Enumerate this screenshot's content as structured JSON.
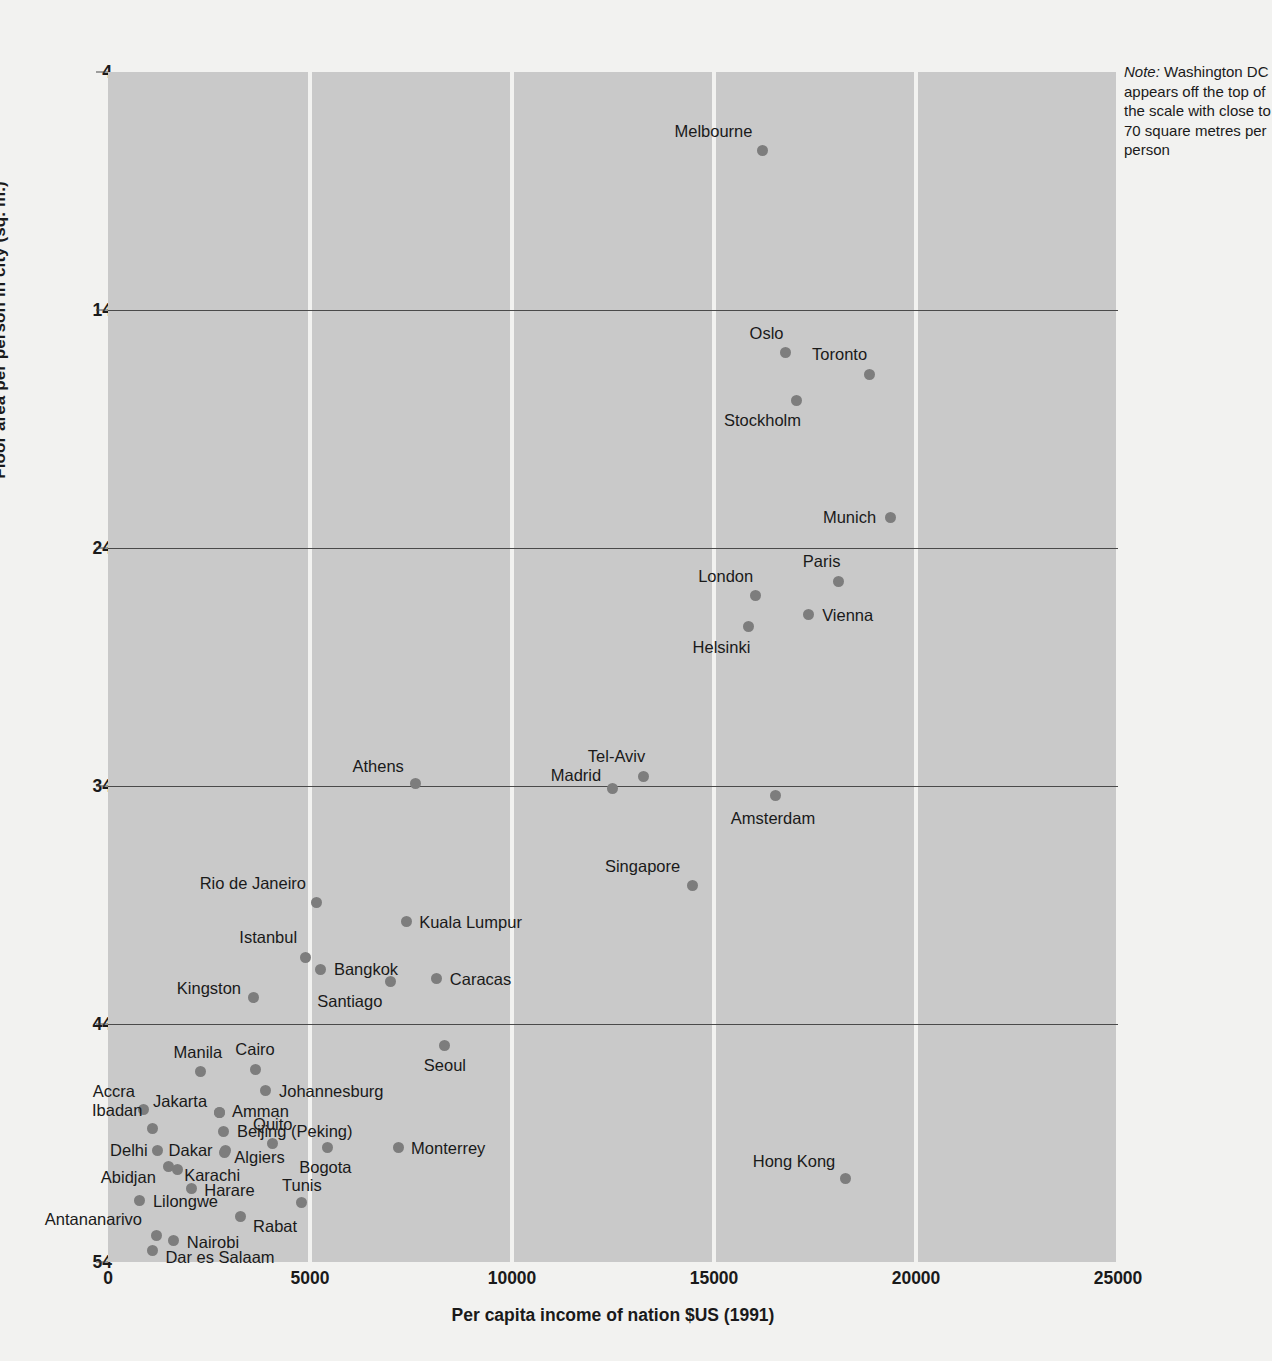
{
  "note": {
    "lead": "Note:",
    "text": " Washington DC appears off the top of the scale with close to 70 square metres per person"
  },
  "axes": {
    "y_title": "Floor area per person in city (sq. m.)",
    "x_title": "Per capita income of nation $US (1991)",
    "y_ticks": [
      "54",
      "44",
      "34",
      "24",
      "14",
      "4"
    ],
    "x_ticks": [
      "0",
      "5000",
      "10000",
      "15000",
      "20000",
      "25000"
    ]
  },
  "colors": {
    "plot_background": "#c9c9c9",
    "page_background": "#f2f2f0",
    "point": "#7d7d7d",
    "gridline": "#4a4a4a",
    "band": "#f2f2f0",
    "text": "#1a1a1a"
  },
  "chart_data": {
    "type": "scatter",
    "title": "",
    "xlabel": "Per capita income of nation $US (1991)",
    "ylabel": "Floor area per person in city (sq. m.)",
    "xlim": [
      0,
      25000
    ],
    "ylim": [
      4,
      54
    ],
    "xticks": [
      0,
      5000,
      10000,
      15000,
      20000,
      25000
    ],
    "yticks": [
      4,
      14,
      24,
      34,
      44,
      54
    ],
    "grid": "horizontal gridlines at y ticks; vertical white bands at x ticks",
    "legend": "none",
    "annotations": [
      "Note: Washington DC appears off the top of the scale with close to 70 square metres per person"
    ],
    "points": [
      {
        "label": "Melbourne",
        "x": 16200,
        "y": 50.7,
        "lx": -10,
        "ly": -20,
        "anchor": "r"
      },
      {
        "label": "Oslo",
        "x": 16770,
        "y": 42.2,
        "lx": -2,
        "ly": -20,
        "anchor": "r"
      },
      {
        "label": "Toronto",
        "x": 18840,
        "y": 41.3,
        "lx": -2,
        "ly": -20,
        "anchor": "r"
      },
      {
        "label": "Stockholm",
        "x": 17030,
        "y": 40.2,
        "lx": 5,
        "ly": 20,
        "anchor": "r"
      },
      {
        "label": "Munich",
        "x": 19360,
        "y": 35.3,
        "lx": -14,
        "ly": 0,
        "anchor": "r"
      },
      {
        "label": "Paris",
        "x": 18080,
        "y": 32.6,
        "lx": 2,
        "ly": -20,
        "anchor": "r"
      },
      {
        "label": "London",
        "x": 16020,
        "y": 32.0,
        "lx": -2,
        "ly": -20,
        "anchor": "r"
      },
      {
        "label": "Vienna",
        "x": 17330,
        "y": 31.2,
        "lx": 14,
        "ly": 0,
        "anchor": "l"
      },
      {
        "label": "Helsinki",
        "x": 15850,
        "y": 30.7,
        "lx": 2,
        "ly": 20,
        "anchor": "r"
      },
      {
        "label": "Tel-Aviv",
        "x": 13250,
        "y": 24.4,
        "lx": 2,
        "ly": -20,
        "anchor": "r"
      },
      {
        "label": "Madrid",
        "x": 12480,
        "y": 23.9,
        "lx": -11,
        "ly": -13,
        "anchor": "r"
      },
      {
        "label": "Athens",
        "x": 7620,
        "y": 24.1,
        "lx": -12,
        "ly": -18,
        "anchor": "r"
      },
      {
        "label": "Amsterdam",
        "x": 16510,
        "y": 23.6,
        "lx": -2,
        "ly": 22,
        "anchor": "c"
      },
      {
        "label": "Singapore",
        "x": 14460,
        "y": 19.8,
        "lx": -12,
        "ly": -20,
        "anchor": "r"
      },
      {
        "label": "Rio de Janeiro",
        "x": 5150,
        "y": 19.1,
        "lx": -10,
        "ly": -20,
        "anchor": "r"
      },
      {
        "label": "Kuala Lumpur",
        "x": 7380,
        "y": 18.3,
        "lx": 13,
        "ly": 0,
        "anchor": "l"
      },
      {
        "label": "Istanbul",
        "x": 4880,
        "y": 16.8,
        "lx": -8,
        "ly": -20,
        "anchor": "r"
      },
      {
        "label": "Bangkok",
        "x": 5270,
        "y": 16.3,
        "lx": 13,
        "ly": 0,
        "anchor": "l"
      },
      {
        "label": "Caracas",
        "x": 8140,
        "y": 15.9,
        "lx": 13,
        "ly": 0,
        "anchor": "l"
      },
      {
        "label": "Santiago",
        "x": 6990,
        "y": 15.8,
        "lx": -8,
        "ly": 20,
        "anchor": "r"
      },
      {
        "label": "Kingston",
        "x": 3590,
        "y": 15.1,
        "lx": -12,
        "ly": -10,
        "anchor": "r"
      },
      {
        "label": "Seoul",
        "x": 8340,
        "y": 13.1,
        "lx": 0,
        "ly": 20,
        "anchor": "c"
      },
      {
        "label": "Cairo",
        "x": 3640,
        "y": 12.1,
        "lx": 0,
        "ly": -20,
        "anchor": "c"
      },
      {
        "label": "Manila",
        "x": 2300,
        "y": 12.0,
        "lx": -3,
        "ly": -20,
        "anchor": "c"
      },
      {
        "label": "Johannesburg",
        "x": 3910,
        "y": 11.2,
        "lx": 13,
        "ly": 0,
        "anchor": "l"
      },
      {
        "label": "Jakarta",
        "x": 2750,
        "y": 10.3,
        "lx": -12,
        "ly": -11,
        "anchor": "r"
      },
      {
        "label": "Accra",
        "x": 890,
        "y": 10.4,
        "lx": -9,
        "ly": -19,
        "anchor": "r"
      },
      {
        "label": "Amman",
        "x": 2750,
        "y": 10.3,
        "lx": 13,
        "ly": -1,
        "anchor": "l"
      },
      {
        "label": "Beijing (Peking)",
        "x": 2870,
        "y": 9.5,
        "lx": 13,
        "ly": 0,
        "anchor": "l"
      },
      {
        "label": "Ibadan",
        "x": 1100,
        "y": 9.6,
        "lx": -10,
        "ly": -19,
        "anchor": "r"
      },
      {
        "label": "Quito",
        "x": 4080,
        "y": 9.0,
        "lx": 0,
        "ly": -19,
        "anchor": "c"
      },
      {
        "label": "Delhi",
        "x": 1230,
        "y": 8.7,
        "lx": -10,
        "ly": 0,
        "anchor": "r"
      },
      {
        "label": "Dakar",
        "x": 2910,
        "y": 8.7,
        "lx": -13,
        "ly": 0,
        "anchor": "r"
      },
      {
        "label": "Algiers",
        "x": 2880,
        "y": 8.6,
        "lx": 10,
        "ly": 4,
        "anchor": "l"
      },
      {
        "label": "Bogota",
        "x": 5430,
        "y": 8.8,
        "lx": -2,
        "ly": 19,
        "anchor": "c"
      },
      {
        "label": "Monterrey",
        "x": 7180,
        "y": 8.8,
        "lx": 13,
        "ly": 0,
        "anchor": "l"
      },
      {
        "label": "Karachi",
        "x": 1490,
        "y": 8.0,
        "lx": 16,
        "ly": 8,
        "anchor": "l"
      },
      {
        "label": "Abidjan",
        "x": 1730,
        "y": 7.9,
        "lx": -22,
        "ly": 8,
        "anchor": "r"
      },
      {
        "label": "Harare",
        "x": 2060,
        "y": 7.1,
        "lx": 13,
        "ly": 2,
        "anchor": "l"
      },
      {
        "label": "Tunis",
        "x": 4800,
        "y": 6.5,
        "lx": 0,
        "ly": -18,
        "anchor": "c"
      },
      {
        "label": "Lilongwe",
        "x": 790,
        "y": 6.6,
        "lx": 13,
        "ly": 1,
        "anchor": "l"
      },
      {
        "label": "Rabat",
        "x": 3270,
        "y": 5.9,
        "lx": 13,
        "ly": 9,
        "anchor": "l"
      },
      {
        "label": "Antananarivo",
        "x": 1190,
        "y": 5.1,
        "lx": -14,
        "ly": -17,
        "anchor": "r"
      },
      {
        "label": "Nairobi",
        "x": 1630,
        "y": 4.9,
        "lx": 13,
        "ly": 1,
        "anchor": "l"
      },
      {
        "label": "Dar es Salaam",
        "x": 1100,
        "y": 4.5,
        "lx": 13,
        "ly": 7,
        "anchor": "l"
      },
      {
        "label": "Hong Kong",
        "x": 18250,
        "y": 7.5,
        "lx": -10,
        "ly": -18,
        "anchor": "r"
      }
    ]
  }
}
